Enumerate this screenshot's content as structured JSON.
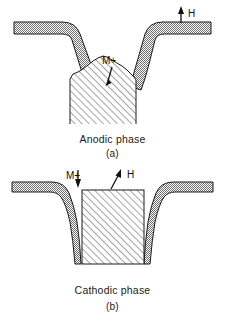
{
  "figure": {
    "type": "scientific-diagram",
    "colors": {
      "ink": "#000000",
      "substrate_stipple": "#8a8a8a",
      "hatch_line": "#555555",
      "background": "#ffffff"
    }
  },
  "panels": [
    {
      "id": "a",
      "caption": "Anodic phase",
      "sub_caption": "(a)",
      "labels": [
        {
          "id": "m-plus",
          "text": "M+",
          "arrow": "up",
          "points_to": "deposit-mound"
        },
        {
          "id": "h",
          "text": "H",
          "arrow": "up",
          "points_to": "substrate-surface"
        }
      ],
      "regions": [
        {
          "name": "substrate-left",
          "fill": "stipple"
        },
        {
          "name": "substrate-right",
          "fill": "stipple"
        },
        {
          "name": "deposit-mound",
          "fill": "hatch"
        },
        {
          "name": "trench-cavity",
          "fill": "none"
        }
      ]
    },
    {
      "id": "b",
      "caption": "Cathodic phase",
      "sub_caption": "(b)",
      "labels": [
        {
          "id": "m-plus",
          "text": "M+",
          "arrow": "down",
          "points_to": "trench-fill"
        },
        {
          "id": "h",
          "text": "H",
          "arrow": "up-right",
          "points_to": "trench-fill"
        }
      ],
      "regions": [
        {
          "name": "substrate-left",
          "fill": "stipple"
        },
        {
          "name": "substrate-right",
          "fill": "stipple"
        },
        {
          "name": "trench-fill",
          "fill": "hatch"
        },
        {
          "name": "trench-cavity",
          "fill": "none"
        }
      ]
    }
  ]
}
